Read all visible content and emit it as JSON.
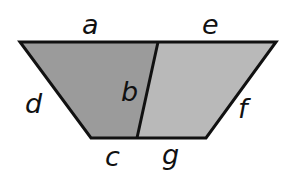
{
  "diagram": {
    "type": "trapezoid-partition",
    "colors": {
      "left_region_fill": "#9b9b9b",
      "right_region_fill": "#b9b9b9",
      "stroke": "#111111",
      "background": "#ffffff"
    },
    "vertices": {
      "top_left": [
        20,
        42
      ],
      "top_divider": [
        158,
        42
      ],
      "top_right": [
        276,
        42
      ],
      "bottom_right": [
        206,
        138
      ],
      "bottom_divider": [
        137,
        138
      ],
      "bottom_left": [
        91,
        138
      ]
    },
    "regions": [
      {
        "name": "left-region",
        "fill": "#9b9b9b",
        "edges": [
          "a",
          "b",
          "c",
          "d"
        ]
      },
      {
        "name": "right-region",
        "fill": "#b9b9b9",
        "edges": [
          "e",
          "f",
          "g",
          "b"
        ]
      }
    ],
    "labels": {
      "a": {
        "text": "a",
        "x": 82,
        "y": 34
      },
      "e": {
        "text": "e",
        "x": 202,
        "y": 34
      },
      "b": {
        "text": "b",
        "x": 121,
        "y": 101
      },
      "d": {
        "text": "d",
        "x": 25,
        "y": 113
      },
      "f": {
        "text": "f",
        "x": 238,
        "y": 118
      },
      "c": {
        "text": "c",
        "x": 105,
        "y": 166
      },
      "g": {
        "text": "g",
        "x": 162,
        "y": 164
      }
    }
  }
}
